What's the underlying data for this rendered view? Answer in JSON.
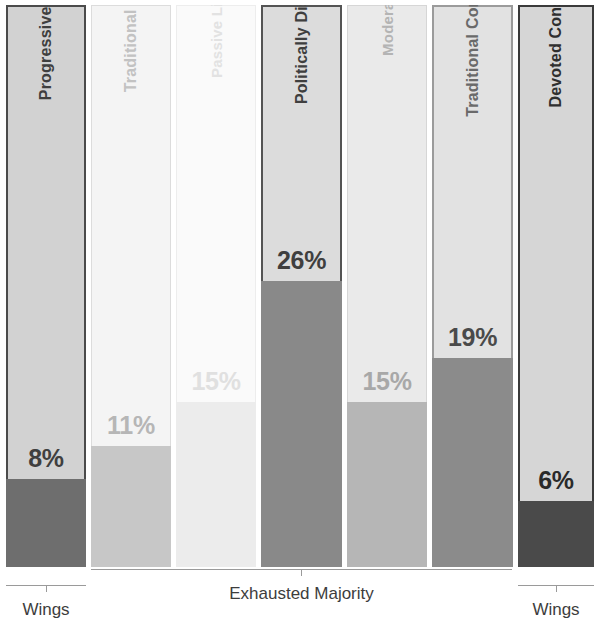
{
  "chart_data": {
    "type": "bar",
    "title": "",
    "subtitle": "",
    "xlabel": "",
    "ylabel": "",
    "orientation": "vertical",
    "grid": false,
    "legend_position": "none",
    "ylim": [
      0,
      100
    ],
    "value_unit": "%",
    "note": "Each column is a full-height container; the shaded portion at the bottom encodes the segment's share of the population.",
    "categories": [
      "Progressive Activists",
      "Traditional Liberals",
      "Passive Liberals",
      "Politically Disengaged",
      "Moderates",
      "Traditional Conservatives",
      "Devoted Conservatives"
    ],
    "values": [
      8,
      11,
      15,
      26,
      15,
      19,
      6
    ],
    "value_labels": [
      "8%",
      "11%",
      "15%",
      "26%",
      "15%",
      "19%",
      "6%"
    ],
    "group_brackets": [
      {
        "label": "Wings",
        "categories": [
          "Progressive Activists"
        ]
      },
      {
        "label": "Exhausted Majority",
        "categories": [
          "Traditional Liberals",
          "Passive Liberals",
          "Politically Disengaged",
          "Moderates",
          "Traditional Conservatives"
        ]
      },
      {
        "label": "Wings",
        "categories": [
          "Devoted Conservatives"
        ]
      }
    ]
  },
  "bars": [
    {
      "name": "progressive-activists",
      "label": "Progressive Activists",
      "value_label": "8%",
      "value": 8,
      "emphasis": "high",
      "bg_color": "#d2d2d2",
      "fill_color": "#6e6e6e",
      "label_color": "#3f3f3f",
      "value_color": "#3f3f3f",
      "border_color": "#4b4b4b"
    },
    {
      "name": "traditional-liberals",
      "label": "Traditional Liberals",
      "value_label": "11%",
      "value": 11,
      "emphasis": "low",
      "bg_color": "#f4f4f4",
      "fill_color": "#c7c7c7",
      "label_color": "#c2c2c2",
      "value_color": "#b6b6b6",
      "border_color": "#dcdcdc"
    },
    {
      "name": "passive-liberals",
      "label": "Passive Liberals",
      "value_label": "15%",
      "value": 15,
      "emphasis": "low",
      "bg_color": "#fafafa",
      "fill_color": "#ececec",
      "label_color": "#e2e2e2",
      "value_color": "#e0e0e0",
      "border_color": "#ededed"
    },
    {
      "name": "politically-disengaged",
      "label": "Politically Disengaged",
      "value_label": "26%",
      "value": 26,
      "emphasis": "high",
      "bg_color": "#dcdcdc",
      "fill_color": "#898989",
      "label_color": "#3f3f3f",
      "value_color": "#3f3f3f",
      "border_color": "#545454"
    },
    {
      "name": "moderates",
      "label": "Moderates",
      "value_label": "15%",
      "value": 15,
      "emphasis": "low",
      "bg_color": "#eaeaea",
      "fill_color": "#b6b6b6",
      "label_color": "#b4b4b4",
      "value_color": "#a8a8a8",
      "border_color": "#d6d6d6"
    },
    {
      "name": "traditional-conservatives",
      "label": "Traditional Conservatives",
      "value_label": "19%",
      "value": 19,
      "emphasis": "high",
      "bg_color": "#e2e2e2",
      "fill_color": "#8b8b8b",
      "label_color": "#6a6a6a",
      "value_color": "#4a4a4a",
      "border_color": "#9b9b9b"
    },
    {
      "name": "devoted-conservatives",
      "label": "Devoted Conservatives",
      "value_label": "6%",
      "value": 6,
      "emphasis": "high",
      "bg_color": "#d6d6d6",
      "fill_color": "#4a4a4a",
      "label_color": "#2f2f2f",
      "value_color": "#2a2a2a",
      "border_color": "#3a3a3a"
    }
  ],
  "brackets": [
    {
      "name": "wings-left",
      "label": "Wings"
    },
    {
      "name": "exhausted-majority",
      "label": "Exhausted Majority"
    },
    {
      "name": "wings-right",
      "label": "Wings"
    }
  ]
}
